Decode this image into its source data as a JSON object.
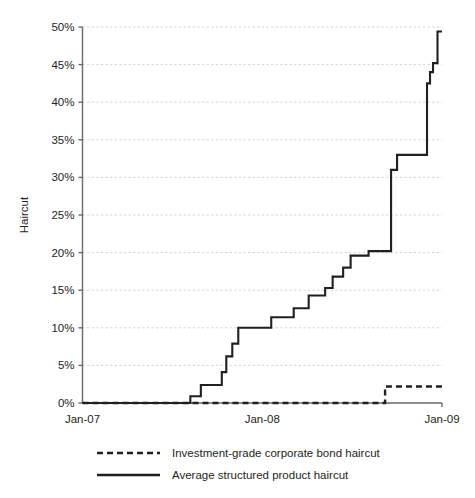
{
  "chart_data": {
    "type": "line",
    "title": "",
    "xlabel": "",
    "ylabel": "Haircut",
    "x_tick_labels": [
      "Jan-07",
      "Jan-08",
      "Jan-09"
    ],
    "x_tick_values": [
      0,
      12,
      24
    ],
    "xlim": [
      0,
      24
    ],
    "y_tick_labels": [
      "0%",
      "5%",
      "10%",
      "15%",
      "20%",
      "25%",
      "30%",
      "35%",
      "40%",
      "45%",
      "50%"
    ],
    "y_tick_values": [
      0,
      5,
      10,
      15,
      20,
      25,
      30,
      35,
      40,
      45,
      50
    ],
    "ylim": [
      0,
      50
    ],
    "grid": true,
    "legend_position": "bottom",
    "x_unit": "months since Jan-07",
    "series": [
      {
        "name": "Investment-grade corporate bond haircut",
        "style": "dashed",
        "color": "#231f20",
        "step": "post",
        "points": [
          {
            "x": 0.0,
            "y": 0.0
          },
          {
            "x": 20.2,
            "y": 0.0
          },
          {
            "x": 20.2,
            "y": 2.2
          },
          {
            "x": 24.0,
            "y": 2.2
          }
        ]
      },
      {
        "name": "Average structured product haircut",
        "style": "solid",
        "color": "#231f20",
        "step": "post",
        "points": [
          {
            "x": 0.0,
            "y": 0.0
          },
          {
            "x": 7.2,
            "y": 0.0
          },
          {
            "x": 7.2,
            "y": 0.9
          },
          {
            "x": 7.9,
            "y": 0.9
          },
          {
            "x": 7.9,
            "y": 2.4
          },
          {
            "x": 9.3,
            "y": 2.4
          },
          {
            "x": 9.3,
            "y": 4.1
          },
          {
            "x": 9.6,
            "y": 4.1
          },
          {
            "x": 9.6,
            "y": 6.2
          },
          {
            "x": 10.0,
            "y": 6.2
          },
          {
            "x": 10.0,
            "y": 7.9
          },
          {
            "x": 10.4,
            "y": 7.9
          },
          {
            "x": 10.4,
            "y": 10.0
          },
          {
            "x": 12.6,
            "y": 10.0
          },
          {
            "x": 12.6,
            "y": 11.4
          },
          {
            "x": 14.1,
            "y": 11.4
          },
          {
            "x": 14.1,
            "y": 12.6
          },
          {
            "x": 15.1,
            "y": 12.6
          },
          {
            "x": 15.1,
            "y": 14.3
          },
          {
            "x": 16.2,
            "y": 14.3
          },
          {
            "x": 16.2,
            "y": 15.3
          },
          {
            "x": 16.7,
            "y": 15.3
          },
          {
            "x": 16.7,
            "y": 16.8
          },
          {
            "x": 17.4,
            "y": 16.8
          },
          {
            "x": 17.4,
            "y": 18.0
          },
          {
            "x": 17.9,
            "y": 18.0
          },
          {
            "x": 17.9,
            "y": 19.6
          },
          {
            "x": 19.1,
            "y": 19.6
          },
          {
            "x": 19.1,
            "y": 20.2
          },
          {
            "x": 20.6,
            "y": 20.2
          },
          {
            "x": 20.6,
            "y": 31.0
          },
          {
            "x": 21.0,
            "y": 31.0
          },
          {
            "x": 21.0,
            "y": 33.0
          },
          {
            "x": 23.0,
            "y": 33.0
          },
          {
            "x": 23.0,
            "y": 42.5
          },
          {
            "x": 23.2,
            "y": 42.5
          },
          {
            "x": 23.2,
            "y": 44.0
          },
          {
            "x": 23.4,
            "y": 44.0
          },
          {
            "x": 23.4,
            "y": 45.2
          },
          {
            "x": 23.7,
            "y": 45.2
          },
          {
            "x": 23.7,
            "y": 49.4
          },
          {
            "x": 24.0,
            "y": 49.4
          }
        ]
      }
    ],
    "legend": [
      {
        "label": "Investment-grade corporate bond haircut",
        "style": "dashed"
      },
      {
        "label": "Average structured product haircut",
        "style": "solid"
      }
    ]
  }
}
